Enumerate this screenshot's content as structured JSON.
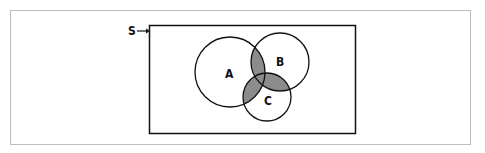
{
  "diagram": {
    "type": "venn",
    "universe_label": "S",
    "sets": [
      {
        "label": "A",
        "cx": 230,
        "cy": 72,
        "r": 35
      },
      {
        "label": "B",
        "cx": 280,
        "cy": 62,
        "r": 29
      },
      {
        "label": "C",
        "cx": 267,
        "cy": 97,
        "r": 24
      }
    ],
    "shaded_regions": [
      "A∩B",
      "A∩C",
      "B∩C"
    ],
    "colors": {
      "stroke": "#111111",
      "shade": "#8c8c8c",
      "frame": "#bdbdbd",
      "background": "#ffffff"
    }
  }
}
